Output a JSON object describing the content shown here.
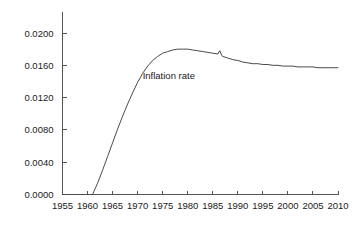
{
  "chart_data": {
    "type": "line",
    "title": "",
    "subtitle": "",
    "xlabel": "",
    "ylabel": "",
    "xlim": [
      1955,
      2010
    ],
    "ylim": [
      0.0,
      0.02
    ],
    "grid": false,
    "legend": "none",
    "annotations": [
      {
        "text": "Inflation rate",
        "x": 1971.0,
        "y": 0.0143
      }
    ],
    "x_ticks": [
      1955,
      1960,
      1965,
      1970,
      1975,
      1980,
      1985,
      1990,
      1995,
      2000,
      2005,
      2010
    ],
    "x_tick_labels": [
      "1955",
      "1960",
      "1965",
      "1970",
      "1975",
      "1980",
      "1985",
      "1990",
      "1995",
      "2000",
      "2005",
      "2010"
    ],
    "y_ticks": [
      0.0,
      0.004,
      0.008,
      0.012,
      0.016,
      0.02
    ],
    "y_tick_labels": [
      "0.0000",
      "0.0040",
      "0.0080",
      "0.0120",
      "0.0160",
      "0.0200"
    ],
    "series": [
      {
        "name": "Inflation rate",
        "color": "#4a4a4a",
        "x": [
          1955,
          1956,
          1957,
          1958,
          1959,
          1960,
          1961,
          1962,
          1963,
          1964,
          1965,
          1966,
          1967,
          1968,
          1969,
          1970,
          1971,
          1972,
          1973,
          1974,
          1975,
          1976,
          1977,
          1978,
          1979,
          1980,
          1981,
          1982,
          1983,
          1984,
          1985,
          1986,
          1986.4,
          1986.8,
          1987,
          1988,
          1989,
          1990,
          1991,
          1992,
          1993,
          1994,
          1995,
          1996,
          1997,
          1998,
          1999,
          2000,
          2001,
          2002,
          2003,
          2004,
          2005,
          2006,
          2007,
          2008,
          2009,
          2010
        ],
        "values": [
          0.0,
          0.0,
          0.0,
          0.0,
          0.0,
          0.0,
          0.0,
          0.0014,
          0.003,
          0.0047,
          0.0064,
          0.0081,
          0.0097,
          0.0112,
          0.0126,
          0.0139,
          0.015,
          0.0159,
          0.0166,
          0.0171,
          0.0175,
          0.0177,
          0.0179,
          0.018,
          0.018,
          0.018,
          0.0179,
          0.0178,
          0.0177,
          0.0176,
          0.0175,
          0.0174,
          0.0178,
          0.0172,
          0.0171,
          0.0169,
          0.0167,
          0.0166,
          0.0164,
          0.0163,
          0.0162,
          0.0162,
          0.0161,
          0.0161,
          0.016,
          0.016,
          0.0159,
          0.0159,
          0.0159,
          0.0158,
          0.0158,
          0.0158,
          0.0158,
          0.0157,
          0.0157,
          0.0157,
          0.0157,
          0.0157
        ]
      }
    ]
  }
}
